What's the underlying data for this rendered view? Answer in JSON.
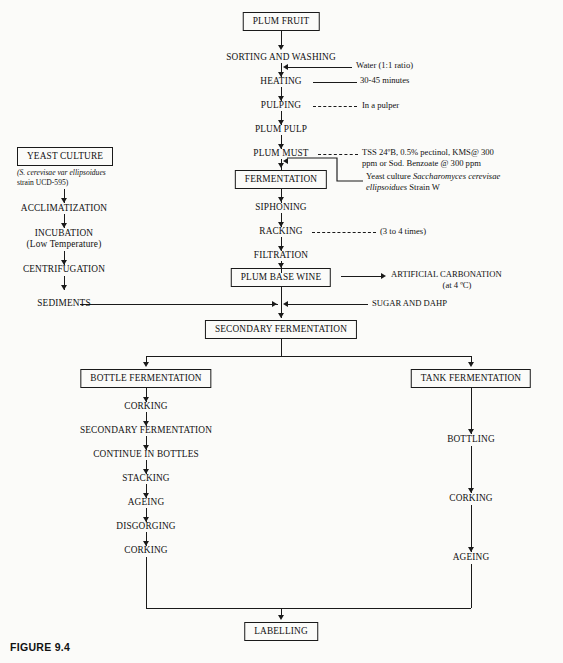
{
  "figure": {
    "caption": "FIGURE 9.4"
  },
  "colors": {
    "ink": "#1a1a1a",
    "paper": "#fbfbf9"
  },
  "main_chain": {
    "nodes": [
      {
        "id": "plum-fruit",
        "label": "PLUM FRUIT",
        "boxed": true
      },
      {
        "id": "sorting-and-washing",
        "label": "SORTING AND WASHING",
        "boxed": false
      },
      {
        "id": "heating",
        "label": "HEATING",
        "boxed": false
      },
      {
        "id": "pulping",
        "label": "PULPING",
        "boxed": false
      },
      {
        "id": "plum-pulp",
        "label": "PLUM PULP",
        "boxed": false
      },
      {
        "id": "plum-must",
        "label": "PLUM MUST",
        "boxed": false
      },
      {
        "id": "fermentation",
        "label": "FERMENTATION",
        "boxed": true
      },
      {
        "id": "siphoning",
        "label": "SIPHONING",
        "boxed": false
      },
      {
        "id": "racking",
        "label": "RACKING",
        "boxed": false
      },
      {
        "id": "filtration",
        "label": "FILTRATION",
        "boxed": false
      },
      {
        "id": "plum-base-wine",
        "label": "PLUM BASE WINE",
        "boxed": true
      },
      {
        "id": "secondary-fermentation",
        "label": "SECONDARY FERMENTATION",
        "boxed": true
      }
    ]
  },
  "annotations": {
    "water": "Water (1:1 ratio)",
    "heating_time": "30-45 minutes",
    "pulper": "In a pulper",
    "must_additives_line1": "TSS 24ºB, 0.5% pectinol, KMS@ 300",
    "must_additives_line2": "ppm or Sod. Benzoate @ 300 ppm",
    "yeast_inoculum_lead": "Yeast culture ",
    "yeast_inoculum_species": "Saccharomyces cerevisae",
    "yeast_inoculum_species2": "ellipsoidues",
    "yeast_inoculum_tail": " Strain W",
    "racking_times": "(3 to 4 times)",
    "artificial_carbonation": "ARTIFICIAL CARBONATION",
    "artificial_carbonation_temp": "(at 4 ºC)",
    "sugar_and_dahp": "SUGAR AND DAHP"
  },
  "yeast_branch": {
    "title": "YEAST CULTURE",
    "strain_line1_italic": "(S. cerevisae var ellipsoidues",
    "strain_line2": "strain UCD-595)",
    "nodes": [
      {
        "id": "acclimatization",
        "label": "ACCLIMATIZATION"
      },
      {
        "id": "incubation",
        "label": "INCUBATION"
      },
      {
        "id": "incubation-note",
        "label": "(Low Temperature)"
      },
      {
        "id": "centrifugation",
        "label": "CENTRIFUGATION"
      },
      {
        "id": "sediments",
        "label": "SEDIMENTS"
      }
    ]
  },
  "bottle_branch": {
    "head": "BOTTLE FERMENTATION",
    "nodes": [
      {
        "id": "bottle-corking-1",
        "label": "CORKING"
      },
      {
        "id": "bottle-secondary-fermentation",
        "label": "SECONDARY FERMENTATION"
      },
      {
        "id": "bottle-continue",
        "label": "CONTINUE IN BOTTLES"
      },
      {
        "id": "bottle-stacking",
        "label": "STACKING"
      },
      {
        "id": "bottle-ageing",
        "label": "AGEING"
      },
      {
        "id": "bottle-disgorging",
        "label": "DISGORGING"
      },
      {
        "id": "bottle-corking-2",
        "label": "CORKING"
      }
    ]
  },
  "tank_branch": {
    "head": "TANK FERMENTATION",
    "nodes": [
      {
        "id": "tank-bottling",
        "label": "BOTTLING"
      },
      {
        "id": "tank-corking",
        "label": "CORKING"
      },
      {
        "id": "tank-ageing",
        "label": "AGEING"
      }
    ]
  },
  "final": {
    "label": "LABELLING"
  }
}
